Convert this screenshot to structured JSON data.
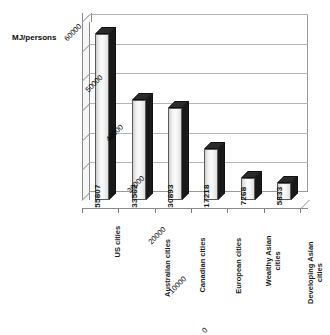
{
  "chart_data": {
    "type": "bar",
    "title": "",
    "subtitle": "",
    "xlabel": "",
    "ylabel": "MJ/persons",
    "categories": [
      "US cities",
      "Australian cities",
      "Canadian cities",
      "European cities",
      "Wealthy Asian cities",
      "Developing Asian cities"
    ],
    "values": [
      55807,
      33562,
      30893,
      17218,
      7268,
      5833
    ],
    "value_labels": [
      "55807",
      "33562",
      "30893",
      "17218",
      "7268",
      "5833"
    ],
    "ylim": [
      0,
      60000
    ],
    "ytick_labels": [
      "0",
      "10000",
      "20000",
      "30000",
      "40000",
      "50000",
      "60000"
    ],
    "ytick_values": [
      0,
      10000,
      20000,
      30000,
      40000,
      50000,
      60000
    ],
    "grid": true,
    "legend": false,
    "legend_position": "none",
    "style": "3d-column",
    "colors": {
      "bar_front": "#f0f0f0",
      "bar_side": "#191919",
      "bar_top": "#2b2b2b",
      "grid": "#b4b4b4",
      "axis": "#8a8a8a",
      "text": "#000000"
    }
  },
  "axis": {
    "y_title": "MJ/persons"
  },
  "categories_wrapped": [
    {
      "line1": "US cities",
      "line2": ""
    },
    {
      "line1": "Australian cities",
      "line2": ""
    },
    {
      "line1": "Canadian cities",
      "line2": ""
    },
    {
      "line1": "European cities",
      "line2": ""
    },
    {
      "line1": "Wealthy Asian",
      "line2": "cities"
    },
    {
      "line1": "Developing Asian",
      "line2": "cities"
    }
  ]
}
